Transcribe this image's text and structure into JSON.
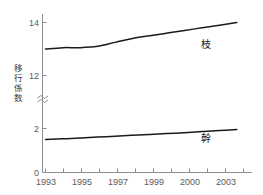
{
  "chart_data": {
    "type": "line",
    "title": "",
    "xlabel": "",
    "ylabel": "移行係数",
    "ylabel_chars": [
      "移",
      "行",
      "係",
      "数"
    ],
    "grid": false,
    "legend_position": "inline-right",
    "axis_break": true,
    "axis_break_between": [
      2,
      12
    ],
    "ytick_labels": [
      "14",
      "12",
      "2",
      "0"
    ],
    "ytick_values": [
      14,
      12,
      2,
      0
    ],
    "ylim_upper": [
      12,
      14.6
    ],
    "ylim_lower": [
      0,
      2.3
    ],
    "xlim": [
      1993,
      2004.5
    ],
    "xtick_labels": [
      "1993",
      "1995",
      "1997",
      "1999",
      "2000",
      "2003"
    ],
    "xtick_values": [
      1993,
      1995,
      1997,
      1999,
      2000,
      2003
    ],
    "x": [
      1993,
      1994,
      1995,
      1996,
      1997,
      1998,
      1999,
      2000,
      2001,
      2002,
      2003,
      2004
    ],
    "series": [
      {
        "name": "枝",
        "label": "枝",
        "color": "#1a1a1a",
        "values": [
          13.0,
          13.05,
          13.05,
          13.1,
          13.25,
          13.4,
          13.5,
          13.6,
          13.7,
          13.8,
          13.9,
          14.0
        ]
      },
      {
        "name": "幹",
        "label": "幹",
        "color": "#1a1a1a",
        "values": [
          1.5,
          1.53,
          1.57,
          1.61,
          1.65,
          1.69,
          1.73,
          1.77,
          1.81,
          1.86,
          1.91,
          1.95
        ]
      }
    ],
    "series_label_positions": [
      {
        "name": "枝",
        "x": 2001.2,
        "y_px": 45
      },
      {
        "name": "幹",
        "x": 2001.2,
        "y_px": 139
      }
    ]
  },
  "colors": {
    "background": "#ffffff",
    "axis": "#8e8e8e",
    "line": "#1a1a1a",
    "tick_text": "#5a5a5a",
    "label_text": "#3a3a3a"
  }
}
